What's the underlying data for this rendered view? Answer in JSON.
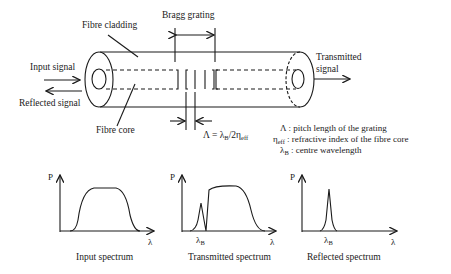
{
  "diagram": {
    "labels": {
      "bragg_grating": "Bragg grating",
      "fibre_cladding": "Fibre cladding",
      "fibre_core": "Fibre core",
      "input_signal": "Input signal",
      "reflected_signal": "Reflected signal",
      "transmitted_signal_line1": "Transmitted",
      "transmitted_signal_line2": "signal",
      "formula_lhs": "Λ = λ",
      "formula_sub1": "B",
      "formula_mid": "/2η",
      "formula_sub2": "eff"
    },
    "legend": [
      {
        "symbol": "Λ",
        "symbol_sub": "",
        "text": " : pitch length of the grating"
      },
      {
        "symbol": "η",
        "symbol_sub": "eff",
        "text": " : refractive index of the fibre core"
      },
      {
        "symbol": "λ",
        "symbol_sub": "B",
        "text": " : centre wavelength"
      }
    ],
    "spectra": [
      {
        "title": "Input spectrum",
        "y_axis": "P",
        "x_axis": "λ",
        "marker": ""
      },
      {
        "title": "Transmitted spectrum",
        "y_axis": "P",
        "x_axis": "λ",
        "marker": "λ",
        "marker_sub": "B"
      },
      {
        "title": "Reflected spectrum",
        "y_axis": "P",
        "x_axis": "λ",
        "marker": "λ",
        "marker_sub": "B"
      }
    ]
  }
}
